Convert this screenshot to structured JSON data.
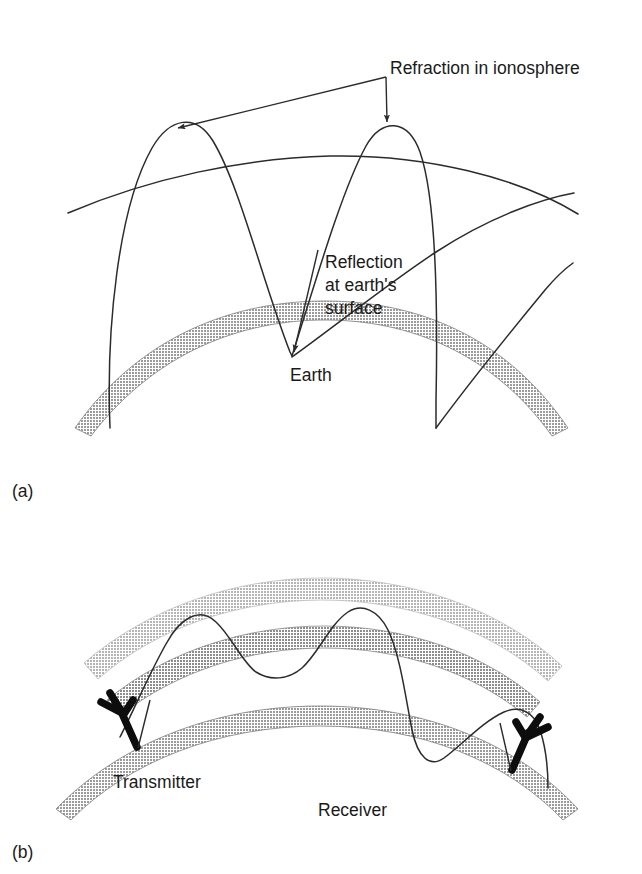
{
  "figure": {
    "background_color": "#ffffff",
    "line_color": "#2b2b2b"
  },
  "panels": [
    {
      "id": "a",
      "label": "(a)",
      "annotations": [
        {
          "name": "refraction-label",
          "text": "Refraction in ionosphere",
          "x": 390,
          "y": 68
        },
        {
          "name": "reflection-label",
          "lines": [
            "Reflection",
            "at earth's",
            "surface"
          ],
          "x": 298,
          "y": 262
        },
        {
          "name": "earth-label",
          "text": "Earth",
          "x": 290,
          "y": 379
        }
      ]
    },
    {
      "id": "b",
      "label": "(b)",
      "annotations": [
        {
          "name": "transmitter-label",
          "text": "Transmitter",
          "x": 113,
          "y": 783
        },
        {
          "name": "receiver-label",
          "text": "Receiver",
          "x": 318,
          "y": 811
        }
      ]
    }
  ],
  "layers": {
    "earth_band_color": "#9a9a9a",
    "ionosphere_outer_color": "#b8b8b8",
    "ionosphere_inner_color": "#8e8e8e",
    "antenna_color": "#0d0d0d"
  },
  "label_text": {
    "refraction": "Refraction in ionosphere",
    "reflection_line1": "Reflection",
    "reflection_line2": "at earth's",
    "reflection_line3": "surface",
    "earth": "Earth",
    "transmitter": "Transmitter",
    "receiver": "Receiver",
    "panel_a": "(a)",
    "panel_b": "(b)"
  }
}
